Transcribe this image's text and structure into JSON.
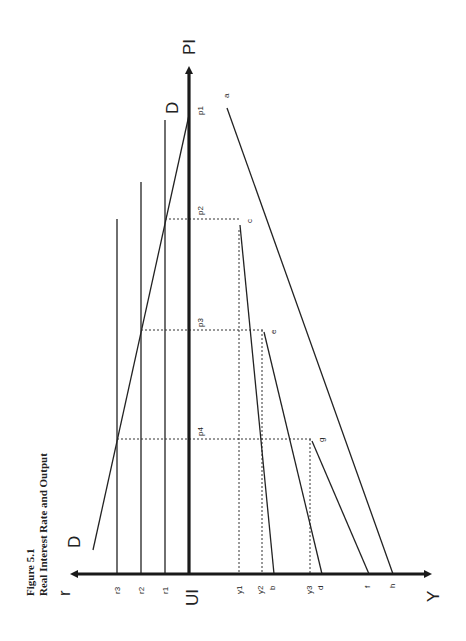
{
  "figure": {
    "number": "Figure 5.1",
    "title": "Real Interest Rate and Output"
  },
  "axes": {
    "vertical_top": "PI",
    "origin": "UI",
    "horizontal_left": "r",
    "horizontal_right": "Y"
  },
  "curves": {
    "demand_top_label": "D",
    "demand_bottom_label": "D"
  },
  "r_ticks": [
    "r3",
    "r2",
    "r1"
  ],
  "p_ticks": [
    "p1",
    "p2",
    "p3",
    "p4"
  ],
  "y_ticks": [
    "y1",
    "y2",
    "b",
    "y3",
    "d",
    "f",
    "h"
  ],
  "points": [
    "a",
    "c",
    "e",
    "g"
  ]
}
